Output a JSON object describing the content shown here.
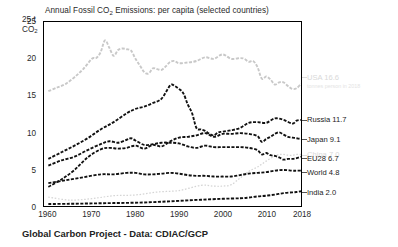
{
  "chart_data": {
    "type": "line",
    "title": "Annual Fossil CO2 Emissions: per capita (selected countries)",
    "title_parts": {
      "pre": "Annual Fossil CO",
      "sub": "2",
      "post": " Emissions: per capita (selected countries)"
    },
    "xlabel": "",
    "ylabel": "t CO2",
    "y_unit_parts": {
      "value": "25 t",
      "pre": "CO",
      "sub": "2"
    },
    "xlim": [
      1959,
      2018
    ],
    "ylim": [
      0,
      25
    ],
    "grid": false,
    "legend_position": "right-inline",
    "xticks": [
      1960,
      1970,
      1980,
      1990,
      2000,
      2010,
      2018
    ],
    "xtick_labels": [
      "1960",
      "1970",
      "1980",
      "1990",
      "2000",
      "2010",
      "2018"
    ],
    "yticks": [
      0,
      5,
      10,
      15,
      20,
      25
    ],
    "ytick_labels": [
      "0",
      "5",
      "10",
      "15",
      "20",
      "25"
    ],
    "annotation": "tonnes person in 2018",
    "series": [
      {
        "name": "USA",
        "label": "USA 16.6",
        "end_value": 16.6,
        "color": "#c8c8c8",
        "style": "dashed",
        "x": [
          1960,
          1962,
          1964,
          1966,
          1968,
          1970,
          1971,
          1972,
          1973,
          1974,
          1975,
          1976,
          1977,
          1978,
          1979,
          1980,
          1981,
          1982,
          1983,
          1984,
          1985,
          1986,
          1987,
          1988,
          1989,
          1990,
          1992,
          1994,
          1996,
          1998,
          2000,
          2002,
          2004,
          2005,
          2006,
          2007,
          2008,
          2009,
          2010,
          2011,
          2012,
          2013,
          2014,
          2015,
          2016,
          2017,
          2018
        ],
        "values": [
          15.6,
          16.1,
          16.6,
          17.5,
          18.6,
          20.0,
          20.1,
          20.9,
          22.5,
          21.5,
          20.4,
          21.2,
          21.4,
          21.3,
          21.1,
          20.0,
          19.1,
          18.2,
          18.0,
          18.7,
          18.6,
          18.5,
          19.0,
          19.6,
          19.7,
          19.4,
          19.5,
          19.7,
          20.2,
          20.0,
          20.6,
          20.0,
          20.1,
          20.0,
          19.6,
          19.7,
          18.9,
          17.3,
          17.6,
          17.2,
          16.5,
          16.8,
          16.8,
          16.3,
          15.9,
          16.0,
          16.6
        ]
      },
      {
        "name": "Russia",
        "label": "Russia 11.7",
        "end_value": 11.7,
        "color": "#111111",
        "style": "dashed",
        "x": [
          1960,
          1963,
          1966,
          1969,
          1972,
          1975,
          1978,
          1980,
          1982,
          1984,
          1986,
          1988,
          1989,
          1990,
          1991,
          1992,
          1993,
          1994,
          1995,
          1996,
          1997,
          1998,
          1999,
          2000,
          2002,
          2004,
          2006,
          2008,
          2010,
          2012,
          2014,
          2016,
          2017,
          2018
        ],
        "values": [
          6.4,
          7.3,
          8.2,
          9.2,
          10.4,
          11.4,
          12.6,
          13.2,
          13.5,
          14.0,
          14.6,
          16.4,
          16.3,
          15.9,
          15.3,
          13.8,
          12.6,
          10.6,
          10.4,
          10.2,
          9.8,
          9.6,
          10.0,
          10.1,
          10.3,
          10.6,
          11.3,
          11.4,
          11.3,
          11.9,
          11.7,
          11.2,
          11.6,
          11.7
        ]
      },
      {
        "name": "Japan",
        "label": "Japan 9.1",
        "end_value": 9.1,
        "color": "#111111",
        "style": "dashed",
        "x": [
          1960,
          1963,
          1966,
          1969,
          1972,
          1974,
          1976,
          1978,
          1980,
          1982,
          1984,
          1986,
          1988,
          1990,
          1992,
          1994,
          1996,
          1998,
          2000,
          2002,
          2004,
          2006,
          2008,
          2009,
          2010,
          2011,
          2012,
          2013,
          2014,
          2015,
          2016,
          2017,
          2018
        ],
        "values": [
          2.6,
          3.6,
          4.9,
          6.6,
          7.7,
          7.9,
          7.8,
          7.9,
          8.2,
          7.8,
          8.3,
          8.1,
          8.8,
          9.3,
          9.4,
          9.6,
          9.9,
          9.4,
          9.8,
          9.8,
          9.9,
          9.8,
          9.5,
          8.7,
          9.1,
          9.4,
          9.8,
          10.0,
          9.7,
          9.4,
          9.3,
          9.2,
          9.1
        ]
      },
      {
        "name": "China",
        "label": "China 7.0",
        "end_value": 7.0,
        "color": "#d5d5d5",
        "style": "dotted",
        "x": [
          1960,
          1965,
          1970,
          1975,
          1980,
          1985,
          1990,
          1995,
          1998,
          2000,
          2002,
          2004,
          2006,
          2008,
          2010,
          2012,
          2013,
          2014,
          2015,
          2016,
          2017,
          2018
        ],
        "values": [
          1.2,
          0.8,
          1.0,
          1.4,
          1.5,
          1.9,
          2.1,
          2.8,
          2.7,
          2.7,
          2.9,
          3.8,
          4.7,
          5.3,
          6.1,
          6.8,
          7.0,
          7.0,
          6.9,
          6.9,
          7.0,
          7.0
        ]
      },
      {
        "name": "EU28",
        "label": "EU28 6.7",
        "end_value": 6.7,
        "color": "#111111",
        "style": "dashed",
        "x": [
          1960,
          1963,
          1966,
          1969,
          1972,
          1974,
          1976,
          1978,
          1979,
          1980,
          1982,
          1984,
          1986,
          1988,
          1990,
          1992,
          1994,
          1996,
          1998,
          2000,
          2002,
          2004,
          2006,
          2008,
          2009,
          2010,
          2011,
          2012,
          2013,
          2014,
          2015,
          2016,
          2017,
          2018
        ],
        "values": [
          5.5,
          6.2,
          6.7,
          7.6,
          8.4,
          8.8,
          8.6,
          9.0,
          9.2,
          8.9,
          8.3,
          8.4,
          8.6,
          8.6,
          8.5,
          8.1,
          7.9,
          8.2,
          8.0,
          8.0,
          8.0,
          8.0,
          7.9,
          7.6,
          7.0,
          7.2,
          6.9,
          6.8,
          6.6,
          6.3,
          6.4,
          6.4,
          6.5,
          6.7
        ]
      },
      {
        "name": "World",
        "label": "World 4.8",
        "end_value": 4.8,
        "color": "#111111",
        "style": "dashed",
        "x": [
          1960,
          1964,
          1968,
          1972,
          1975,
          1978,
          1980,
          1982,
          1984,
          1986,
          1988,
          1990,
          1992,
          1994,
          1996,
          1998,
          2000,
          2002,
          2004,
          2006,
          2008,
          2010,
          2012,
          2014,
          2016,
          2017,
          2018
        ],
        "values": [
          3.1,
          3.5,
          3.9,
          4.3,
          4.3,
          4.5,
          4.5,
          4.3,
          4.3,
          4.4,
          4.5,
          4.4,
          4.2,
          4.1,
          4.1,
          4.0,
          4.0,
          4.0,
          4.2,
          4.4,
          4.5,
          4.6,
          4.8,
          4.9,
          4.8,
          4.8,
          4.8
        ]
      },
      {
        "name": "India",
        "label": "India 2.0",
        "end_value": 2.0,
        "color": "#111111",
        "style": "dashed",
        "x": [
          1960,
          1965,
          1970,
          1975,
          1980,
          1985,
          1990,
          1995,
          2000,
          2004,
          2006,
          2008,
          2010,
          2012,
          2014,
          2016,
          2017,
          2018
        ],
        "values": [
          0.27,
          0.3,
          0.35,
          0.4,
          0.45,
          0.55,
          0.7,
          0.85,
          0.98,
          1.05,
          1.15,
          1.3,
          1.4,
          1.55,
          1.75,
          1.85,
          1.9,
          2.0
        ]
      }
    ]
  },
  "footer": {
    "text": "Global Carbon Project - Data: CDIAC/GCP"
  }
}
